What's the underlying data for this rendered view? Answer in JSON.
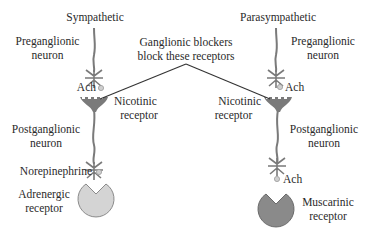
{
  "diagram": {
    "sympathetic": {
      "title": "Sympathetic",
      "preganglionic_label_1": "Preganglionic",
      "preganglionic_label_2": "neuron",
      "neurotransmitter_1": "Ach",
      "ganglion_receptor_1": "Nicotinic",
      "ganglion_receptor_2": "receptor",
      "postganglionic_label_1": "Postganglionic",
      "postganglionic_label_2": "neuron",
      "neurotransmitter_2": "Norepinephrine",
      "target_receptor_1": "Adrenergic",
      "target_receptor_2": "receptor",
      "target_receptor_color": "#d4d4d4"
    },
    "parasympathetic": {
      "title": "Parasympathetic",
      "preganglionic_label_1": "Preganglionic",
      "preganglionic_label_2": "neuron",
      "neurotransmitter_1": "Ach",
      "ganglion_receptor_1": "Nicotinic",
      "ganglion_receptor_2": "receptor",
      "postganglionic_label_1": "Postganglionic",
      "postganglionic_label_2": "neuron",
      "neurotransmitter_2": "Ach",
      "target_receptor_1": "Muscarinic",
      "target_receptor_2": "receptor",
      "target_receptor_color": "#8a8a8a"
    },
    "callout": {
      "line_1": "Ganglionic blockers",
      "line_2": "block these receptors"
    },
    "colors": {
      "neuron": "#7a7a7a",
      "text": "#2a2a2a",
      "molecule": "#bdbdbd"
    }
  }
}
